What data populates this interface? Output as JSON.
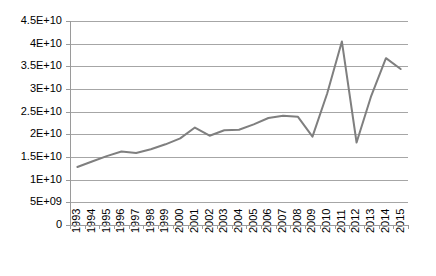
{
  "chart_data": {
    "type": "line",
    "title": "",
    "subtitle": "",
    "xlabel": "",
    "ylabel": "",
    "categories": [
      "1993",
      "1994",
      "1995",
      "1996",
      "1997",
      "1998",
      "1999",
      "2000",
      "2001",
      "2002",
      "2003",
      "2004",
      "2005",
      "2006",
      "2007",
      "2008",
      "2009",
      "2010",
      "2011",
      "2012",
      "2013",
      "2014",
      "2015"
    ],
    "values": [
      12800000000,
      14000000000,
      15200000000,
      16200000000,
      15900000000,
      16700000000,
      17800000000,
      19100000000,
      21500000000,
      19700000000,
      20900000000,
      21000000000,
      22200000000,
      23600000000,
      24100000000,
      23900000000,
      19500000000,
      29000000000,
      40500000000,
      18200000000,
      28500000000,
      36800000000,
      34400000000
    ],
    "series": [
      {
        "name": "series-1",
        "color": "#7f7f7f",
        "values": [
          12800000000,
          14000000000,
          15200000000,
          16200000000,
          15900000000,
          16700000000,
          17800000000,
          19100000000,
          21500000000,
          19700000000,
          20900000000,
          21000000000,
          22200000000,
          23600000000,
          24100000000,
          23900000000,
          19500000000,
          29000000000,
          40500000000,
          18200000000,
          28500000000,
          36800000000,
          34400000000
        ]
      }
    ],
    "ylim": [
      0,
      45000000000
    ],
    "ytick_values": [
      0,
      5000000000,
      10000000000,
      15000000000,
      20000000000,
      25000000000,
      30000000000,
      35000000000,
      40000000000,
      45000000000
    ],
    "ytick_labels": [
      "0",
      "5E+09",
      "1E+10",
      "1.5E+10",
      "2E+10",
      "2.5E+10",
      "3E+10",
      "3.5E+10",
      "4E+10",
      "4.5E+10"
    ],
    "xtick_labels": [
      "1993",
      "1994",
      "1995",
      "1996",
      "1997",
      "1998",
      "1999",
      "2000",
      "2001",
      "2002",
      "2003",
      "2004",
      "2005",
      "2006",
      "2007",
      "2008",
      "2009",
      "2010",
      "2011",
      "2012",
      "2013",
      "2014",
      "2015"
    ],
    "grid": true,
    "grid_axis": "y",
    "legend": false,
    "legend_position": "none",
    "annotations": []
  },
  "style": {
    "line_color": "#7f7f7f",
    "grid_color": "#a6a6a6",
    "axis_color": "#9a9a9a",
    "text_color": "#000000",
    "background": "#ffffff"
  },
  "layout": {
    "plot_left": 70,
    "plot_right": 408,
    "plot_top": 21,
    "plot_bottom": 225,
    "xtick_spacing": 15.0,
    "ytick_spacing": 22.6
  }
}
